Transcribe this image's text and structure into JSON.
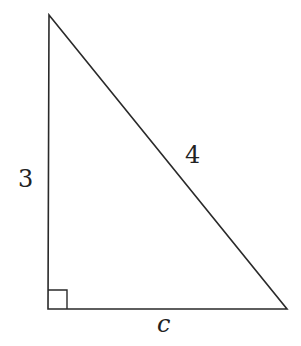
{
  "diagram": {
    "type": "right-triangle",
    "stroke_color": "#2a2a2a",
    "vertices": {
      "top": [
        49,
        15
      ],
      "right_angle": [
        48,
        309
      ],
      "bottom_right": [
        287,
        309
      ]
    },
    "labels": {
      "vertical_leg": "3",
      "hypotenuse": "4",
      "horizontal_leg": "c"
    },
    "right_angle_marker": true
  }
}
